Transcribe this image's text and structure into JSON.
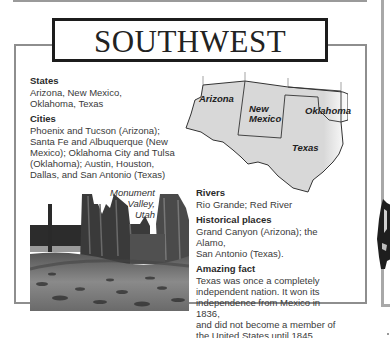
{
  "title": "SOUTHWEST",
  "sections": {
    "states": {
      "heading": "States",
      "lines": [
        "Arizona, New Mexico,",
        "Oklahoma, Texas"
      ]
    },
    "cities": {
      "heading": "Cities",
      "lines": [
        "Phoenix and Tucson (Arizona);",
        "Santa Fe and Albuquerque (New",
        "Mexico); Oklahoma City and Tulsa",
        "(Oklahoma); Austin, Houston,",
        "Dallas, and San Antonio (Texas)"
      ]
    },
    "rivers": {
      "heading": "Rivers",
      "lines": [
        "Rio Grande; Red River"
      ]
    },
    "historical_places": {
      "heading": "Historical places",
      "lines": [
        "Grand Canyon (Arizona); the Alamo,",
        "San Antonio (Texas)."
      ]
    },
    "amazing_fact": {
      "heading": "Amazing fact",
      "lines": [
        "Texas was once a completely",
        "independent nation. It won its",
        "independence from Mexico in 1836,",
        "and did not become a member of",
        "the United States until 1845."
      ]
    }
  },
  "map": {
    "labels": {
      "arizona": "Arizona",
      "new_mexico_1": "New",
      "new_mexico_2": "Mexico",
      "oklahoma": "Oklahoma",
      "texas": "Texas"
    },
    "fill_color": "#dcdcdc",
    "border_color": "#333333"
  },
  "photo": {
    "caption_lines": [
      "Monument",
      "Valley,",
      "Utah"
    ]
  },
  "colors": {
    "frame_gray": "#8e8e8e",
    "title_border": "#1c1c1c",
    "text": "#333333"
  }
}
